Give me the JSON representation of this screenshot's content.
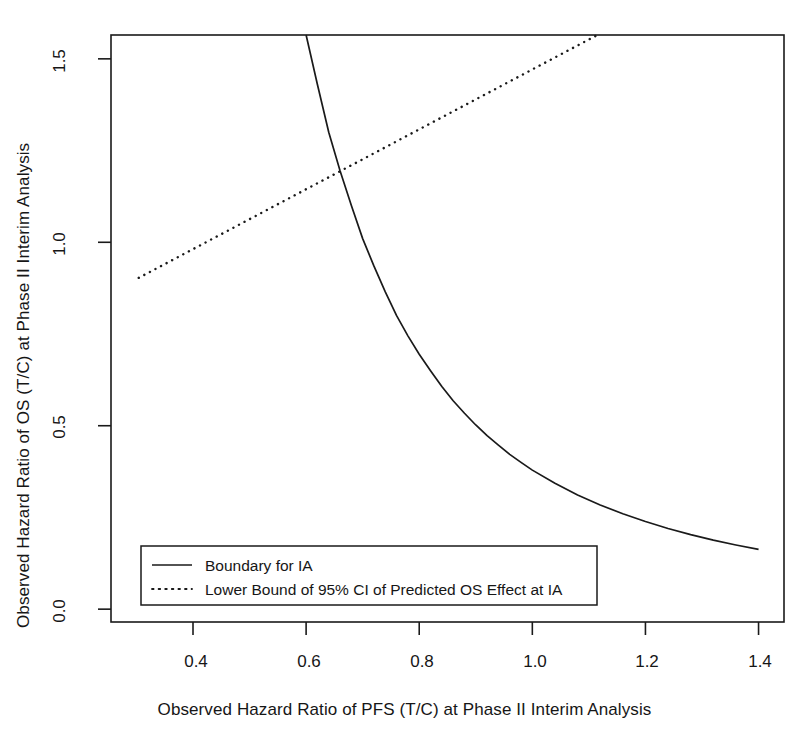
{
  "chart_data": {
    "type": "line",
    "title": "",
    "xlabel": "Observed Hazard Ratio of PFS (T/C) at Phase II Interim Analysis",
    "ylabel": "Observed Hazard Ratio of OS (T/C) at Phase II Interim Analysis",
    "xlim": [
      0.255,
      1.445
    ],
    "ylim": [
      -0.035,
      1.565
    ],
    "xticks": [
      0.4,
      0.6,
      0.8,
      1.0,
      1.2,
      1.4
    ],
    "xtick_labels": [
      "0.4",
      "0.6",
      "0.8",
      "1.0",
      "1.2",
      "1.4"
    ],
    "yticks": [
      0.0,
      0.5,
      1.0,
      1.5
    ],
    "ytick_labels": [
      "0.0",
      "0.5",
      "1.0",
      "1.5"
    ],
    "grid": false,
    "legend_position": "bottom-left",
    "series": [
      {
        "name": "Boundary for IA",
        "style": "solid",
        "color": "#1a1a1a",
        "points": [
          [
            0.6,
            1.565
          ],
          [
            0.62,
            1.43
          ],
          [
            0.64,
            1.3
          ],
          [
            0.66,
            1.195
          ],
          [
            0.68,
            1.1
          ],
          [
            0.7,
            1.01
          ],
          [
            0.72,
            0.935
          ],
          [
            0.74,
            0.865
          ],
          [
            0.76,
            0.8
          ],
          [
            0.78,
            0.745
          ],
          [
            0.8,
            0.695
          ],
          [
            0.82,
            0.65
          ],
          [
            0.84,
            0.607
          ],
          [
            0.86,
            0.568
          ],
          [
            0.88,
            0.534
          ],
          [
            0.9,
            0.502
          ],
          [
            0.92,
            0.473
          ],
          [
            0.94,
            0.447
          ],
          [
            0.96,
            0.422
          ],
          [
            0.98,
            0.4
          ],
          [
            1.0,
            0.379
          ],
          [
            1.04,
            0.343
          ],
          [
            1.08,
            0.311
          ],
          [
            1.12,
            0.284
          ],
          [
            1.16,
            0.26
          ],
          [
            1.2,
            0.239
          ],
          [
            1.24,
            0.22
          ],
          [
            1.28,
            0.203
          ],
          [
            1.32,
            0.188
          ],
          [
            1.36,
            0.175
          ],
          [
            1.4,
            0.163
          ]
        ]
      },
      {
        "name": "Lower Bound of 95% CI of Predicted OS Effect at IA",
        "style": "dotted",
        "color": "#1a1a1a",
        "points": [
          [
            0.304,
            0.903
          ],
          [
            1.115,
            1.565
          ]
        ]
      }
    ],
    "legend": [
      {
        "label": "Boundary for IA",
        "style": "solid"
      },
      {
        "label": "Lower Bound of 95% CI of Predicted OS Effect at IA",
        "style": "dotted"
      }
    ]
  },
  "figure": {
    "background_color": "#ffffff",
    "axis_color": "#1a1a1a"
  }
}
